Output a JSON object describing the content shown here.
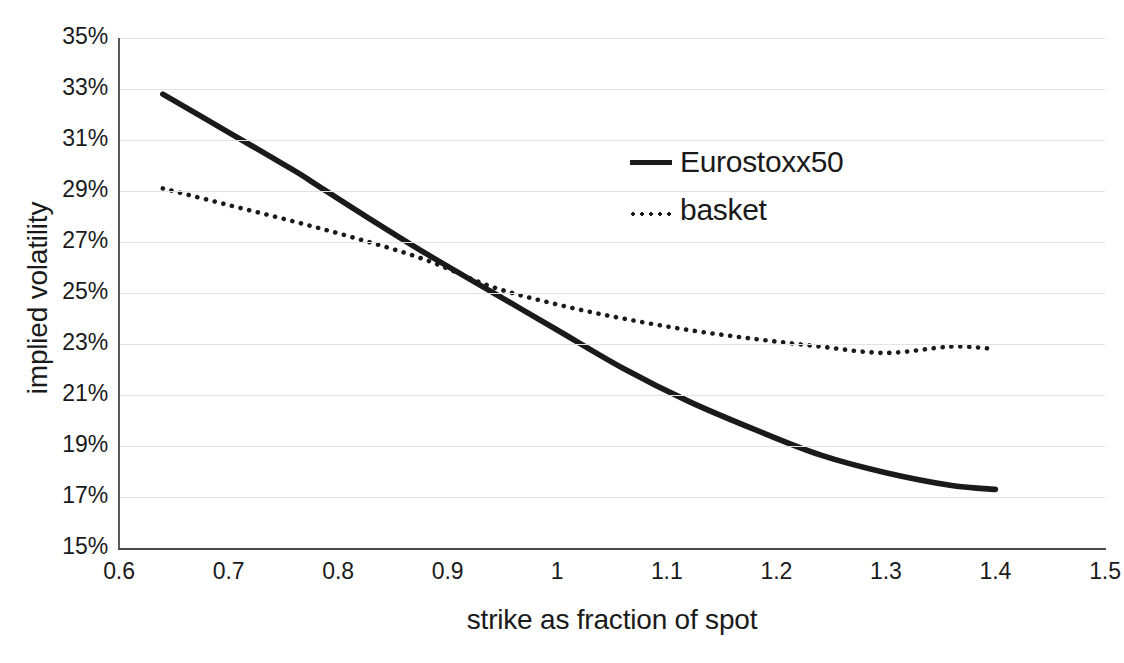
{
  "chart_data": {
    "type": "line",
    "title": "",
    "xlabel": "strike as fraction of spot",
    "ylabel": "implied volatility",
    "xlim": [
      0.6,
      1.5
    ],
    "ylim": [
      0.15,
      0.35
    ],
    "grid": true,
    "legend_position": "inside-upper-right",
    "x_tick_labels": [
      "0.6",
      "0.7",
      "0.8",
      "0.9",
      "1",
      "1.1",
      "1.2",
      "1.3",
      "1.4",
      "1.5"
    ],
    "x_tick_values": [
      0.6,
      0.7,
      0.8,
      0.9,
      1.0,
      1.1,
      1.2,
      1.3,
      1.4,
      1.5
    ],
    "y_tick_labels": [
      "35%",
      "33%",
      "31%",
      "29%",
      "27%",
      "25%",
      "23%",
      "21%",
      "19%",
      "17%",
      "15%"
    ],
    "y_tick_values": [
      0.35,
      0.33,
      0.31,
      0.29,
      0.27,
      0.25,
      0.23,
      0.21,
      0.19,
      0.17,
      0.15
    ],
    "series": [
      {
        "name": "Eurostoxx50",
        "style": "solid",
        "color": "#1a1a1a",
        "x": [
          0.64,
          0.7,
          0.76,
          0.78,
          0.82,
          0.88,
          0.94,
          1.0,
          1.06,
          1.12,
          1.18,
          1.24,
          1.3,
          1.36,
          1.4
        ],
        "y": [
          0.328,
          0.313,
          0.298,
          0.2925,
          0.2815,
          0.2655,
          0.2505,
          0.2355,
          0.2205,
          0.2075,
          0.1965,
          0.1865,
          0.1795,
          0.1745,
          0.173
        ]
      },
      {
        "name": "basket",
        "style": "dotted",
        "color": "#1a1a1a",
        "x": [
          0.64,
          0.7,
          0.76,
          0.82,
          0.88,
          0.94,
          1.0,
          1.06,
          1.12,
          1.18,
          1.24,
          1.3,
          1.36,
          1.4
        ],
        "y": [
          0.291,
          0.2845,
          0.278,
          0.271,
          0.263,
          0.2525,
          0.2455,
          0.24,
          0.2355,
          0.232,
          0.229,
          0.2265,
          0.229,
          0.228
        ]
      }
    ]
  },
  "legend": {
    "entries": [
      {
        "label": "Eurostoxx50",
        "style": "solid"
      },
      {
        "label": "basket",
        "style": "dotted"
      }
    ]
  }
}
